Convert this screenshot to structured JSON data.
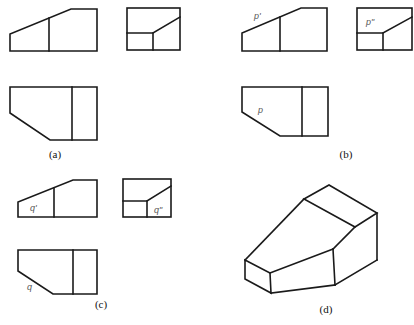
{
  "figure": {
    "panels": [
      {
        "id": "a",
        "caption": "(a)",
        "views": {
          "front": {
            "label": ""
          },
          "side": {
            "label": ""
          },
          "top": {
            "label": ""
          }
        }
      },
      {
        "id": "b",
        "caption": "(b)",
        "views": {
          "front": {
            "label": "p'"
          },
          "side": {
            "label": "p\""
          },
          "top": {
            "label": "p"
          }
        }
      },
      {
        "id": "c",
        "caption": "(c)",
        "views": {
          "front": {
            "label": "q'"
          },
          "side": {
            "label": "q\""
          },
          "top": {
            "label": "q"
          }
        }
      },
      {
        "id": "d",
        "caption": "(d)",
        "views": {
          "isometric": {
            "label": ""
          }
        }
      }
    ]
  },
  "colors": {
    "line": "#1a1a1a",
    "label": "#555555",
    "background": "#ffffff"
  }
}
